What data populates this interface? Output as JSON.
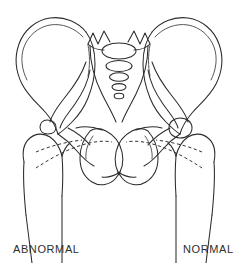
{
  "figure": {
    "background_color": "#ffffff",
    "line_color": "#2b2b2b",
    "dashed_line_color": "#333333"
  },
  "labels": {
    "left": "ABNORMAL",
    "right": "NORMAL"
  },
  "anatomy": {
    "sacrum": {
      "name": "sacrum",
      "vertebral_body_count": 5,
      "description": "Midline sacrum with five stacked vertebral bodies decreasing in size inferiorly and transverse process spikes superiorly"
    },
    "left_side": {
      "name": "abnormal-hip",
      "condition": "ABNORMAL",
      "iliac_wing": "left-iliac-wing",
      "acetabulum": "shallow-dysplastic-acetabulum",
      "femoral_head": "laterally-displaced-femoral-head",
      "shenton_line": "broken",
      "obturator_foramen": "left-obturator-foramen"
    },
    "right_side": {
      "name": "normal-hip",
      "condition": "NORMAL",
      "iliac_wing": "right-iliac-wing",
      "acetabulum": "well-formed-acetabulum",
      "femoral_head": "concentrically-seated-femoral-head",
      "shenton_line": "continuous",
      "obturator_foramen": "right-obturator-foramen"
    }
  }
}
